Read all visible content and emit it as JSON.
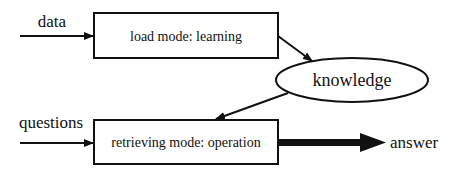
{
  "diagram": {
    "inputs": {
      "data_label": "data",
      "questions_label": "questions"
    },
    "nodes": {
      "load_box": "load mode: learning",
      "knowledge_ellipse": "knowledge",
      "retrieve_box": "retrieving mode: operation"
    },
    "outputs": {
      "answer_label": "answer"
    },
    "edges": [
      {
        "from": "data",
        "to": "load mode: learning"
      },
      {
        "from": "load mode: learning",
        "to": "knowledge"
      },
      {
        "from": "knowledge",
        "to": "retrieving mode: operation"
      },
      {
        "from": "questions",
        "to": "retrieving mode: operation"
      },
      {
        "from": "retrieving mode: operation",
        "to": "answer",
        "style": "thick"
      }
    ],
    "colors": {
      "stroke": "#111111",
      "background": "#ffffff"
    }
  }
}
